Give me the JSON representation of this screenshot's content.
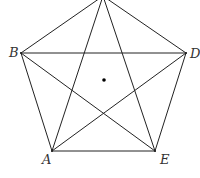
{
  "figure": {
    "type": "regular pentagon with all diagonals (pentagram) and center point",
    "stroke_color": "#222222",
    "vertices": [
      {
        "name": "C",
        "label": "",
        "x": 103,
        "y": -4
      },
      {
        "name": "B",
        "label": "B",
        "x": 21,
        "y": 53
      },
      {
        "name": "D",
        "label": "D",
        "x": 186,
        "y": 53
      },
      {
        "name": "A",
        "label": "A",
        "x": 52,
        "y": 151
      },
      {
        "name": "E",
        "label": "E",
        "x": 155,
        "y": 151
      }
    ],
    "center": {
      "x": 104,
      "y": 80
    },
    "labels": {
      "B": "B",
      "D": "D",
      "A": "A",
      "E": "E"
    }
  }
}
